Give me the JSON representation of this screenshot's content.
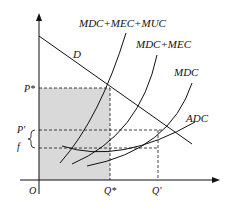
{
  "diagram": {
    "title": "",
    "axes": {
      "origin_label": "O"
    },
    "curves": {
      "demand": "D",
      "mdc_mec_muc": "MDC+MEC+MUC",
      "mdc_mec": "MDC+MEC",
      "mdc": "MDC",
      "adc": "ADC"
    },
    "y_labels": {
      "p_star": "P*",
      "p_prime": "P'",
      "f": "f"
    },
    "x_labels": {
      "q_star": "Q*",
      "q_prime": "Q'"
    },
    "colors": {
      "shade": "#d9d9d9",
      "line": "#111111"
    }
  }
}
